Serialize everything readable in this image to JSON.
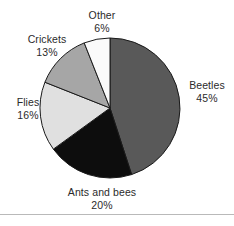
{
  "chart_data": {
    "type": "pie",
    "title": "",
    "subtitle": "",
    "xlabel": "",
    "ylabel": "",
    "grid": false,
    "legend_position": "outside-labels",
    "start_angle_deg": 0,
    "direction": "clockwise",
    "center": {
      "x": 110,
      "y": 108
    },
    "radius": 70,
    "total_percent": 100,
    "categories": [
      "Beetles",
      "Ants and bees",
      "Flies",
      "Crickets",
      "Other"
    ],
    "values": [
      45,
      20,
      16,
      13,
      6
    ],
    "value_suffix": "%",
    "slices": [
      {
        "label": "Beetles",
        "value": 45,
        "value_text": "45%",
        "color": "#595959",
        "stroke": "#1a1a1a",
        "label_x": 180,
        "label_y": 79
      },
      {
        "label": "Ants and bees",
        "value": 20,
        "value_text": "20%",
        "color": "#0d0d0d",
        "stroke": "#1a1a1a",
        "label_x": 44,
        "label_y": 186
      },
      {
        "label": "Flies",
        "value": 16,
        "value_text": "16%",
        "color": "#e0e0e0",
        "stroke": "#1a1a1a",
        "label_x": 4,
        "label_y": 96
      },
      {
        "label": "Crickets",
        "value": 13,
        "value_text": "13%",
        "color": "#a6a6a6",
        "stroke": "#1a1a1a",
        "label_x": 14,
        "label_y": 33
      },
      {
        "label": "Other",
        "value": 6,
        "value_text": "6%",
        "color": "#fafafa",
        "stroke": "#1a1a1a",
        "label_x": 74,
        "label_y": 9
      }
    ]
  },
  "labels": {
    "beetles": {
      "name": "Beetles",
      "value": "45%"
    },
    "ants": {
      "name": "Ants and bees",
      "value": "20%"
    },
    "flies": {
      "name": "Flies",
      "value": "16%"
    },
    "crickets": {
      "name": "Crickets",
      "value": "13%"
    },
    "other": {
      "name": "Other",
      "value": "6%"
    }
  },
  "style": {
    "background": "#ffffff",
    "text_color": "#2b2b2b",
    "outline_color": "#1a1a1a",
    "rule_color": "#b9b9b9"
  }
}
